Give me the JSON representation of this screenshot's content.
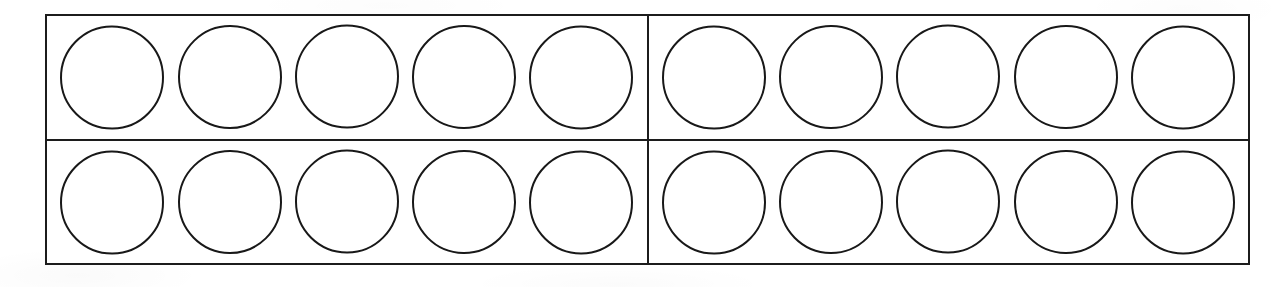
{
  "worksheet": {
    "kind": "double-ten-frame",
    "description": "Blank double ten-frame with twenty empty counter circles",
    "frame": {
      "total_cells": 20,
      "rows": 2,
      "columns_per_group": 5,
      "groups": 2,
      "filled_count": 0,
      "empty_count": 20
    },
    "colors": {
      "border": "#1c1c1c",
      "circle_outline": "#181818",
      "background": "#ffffff"
    },
    "rows": [
      {
        "row_label": "row-1",
        "groups": [
          {
            "group_label": "group-1",
            "cells": [
              {
                "cell_label": "cell-1",
                "state": "empty"
              },
              {
                "cell_label": "cell-2",
                "state": "empty"
              },
              {
                "cell_label": "cell-3",
                "state": "empty"
              },
              {
                "cell_label": "cell-4",
                "state": "empty"
              },
              {
                "cell_label": "cell-5",
                "state": "empty"
              }
            ]
          },
          {
            "group_label": "group-2",
            "cells": [
              {
                "cell_label": "cell-6",
                "state": "empty"
              },
              {
                "cell_label": "cell-7",
                "state": "empty"
              },
              {
                "cell_label": "cell-8",
                "state": "empty"
              },
              {
                "cell_label": "cell-9",
                "state": "empty"
              },
              {
                "cell_label": "cell-10",
                "state": "empty"
              }
            ]
          }
        ]
      },
      {
        "row_label": "row-2",
        "groups": [
          {
            "group_label": "group-3",
            "cells": [
              {
                "cell_label": "cell-11",
                "state": "empty"
              },
              {
                "cell_label": "cell-12",
                "state": "empty"
              },
              {
                "cell_label": "cell-13",
                "state": "empty"
              },
              {
                "cell_label": "cell-14",
                "state": "empty"
              },
              {
                "cell_label": "cell-15",
                "state": "empty"
              }
            ]
          },
          {
            "group_label": "group-4",
            "cells": [
              {
                "cell_label": "cell-16",
                "state": "empty"
              },
              {
                "cell_label": "cell-17",
                "state": "empty"
              },
              {
                "cell_label": "cell-18",
                "state": "empty"
              },
              {
                "cell_label": "cell-19",
                "state": "empty"
              },
              {
                "cell_label": "cell-20",
                "state": "empty"
              }
            ]
          }
        ]
      }
    ]
  }
}
